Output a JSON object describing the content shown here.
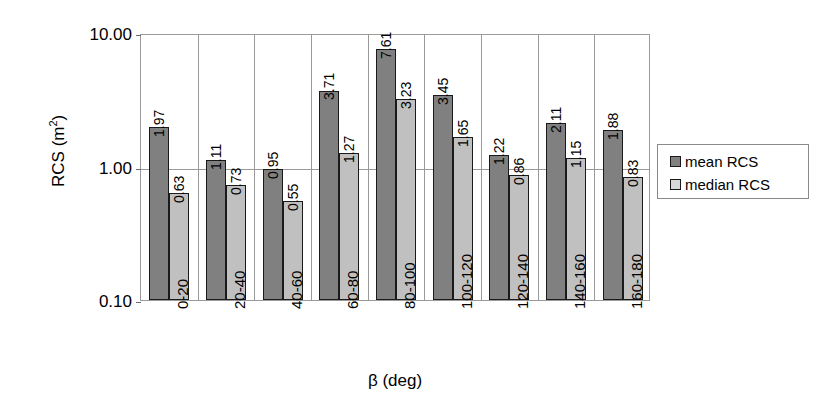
{
  "chart_data": {
    "type": "bar",
    "title": "",
    "xlabel": "β (deg)",
    "ylabel": "RCS (m²)",
    "yscale": "log",
    "ylim": [
      0.1,
      10.0
    ],
    "ytick_labels": [
      "10.00",
      "1.00",
      "0.10"
    ],
    "ytick_values": [
      10.0,
      1.0,
      0.1
    ],
    "grid": true,
    "legend_position": "right",
    "categories": [
      "0-20",
      "20-40",
      "40-60",
      "60-80",
      "80-100",
      "100-120",
      "120-140",
      "140-160",
      "160-180"
    ],
    "series": [
      {
        "name": "mean RCS",
        "color": "#808080",
        "values": [
          1.97,
          1.11,
          0.95,
          3.71,
          7.61,
          3.45,
          1.22,
          2.11,
          1.88
        ],
        "labels": [
          "1.97",
          "1.11",
          "0.95",
          "3.71",
          "7.61",
          "3.45",
          "1.22",
          "2.11",
          "1.88"
        ]
      },
      {
        "name": "median RCS",
        "color": "#c0c0c0",
        "values": [
          0.63,
          0.73,
          0.55,
          1.27,
          3.23,
          1.65,
          0.86,
          1.15,
          0.83
        ],
        "labels": [
          "0.63",
          "0.73",
          "0.55",
          "1.27",
          "3.23",
          "1.65",
          "0.86",
          "1.15",
          "0.83"
        ]
      }
    ]
  },
  "axes": {
    "y_title_main": "RCS (m",
    "y_title_sup": "2",
    "y_title_tail": ")",
    "x_title": "β (deg)"
  },
  "legend": {
    "entries": [
      {
        "label": "mean RCS",
        "swatch": "mean"
      },
      {
        "label": "median RCS",
        "swatch": "median"
      }
    ]
  },
  "colors": {
    "mean": "#808080",
    "median": "#c0c0c0",
    "axis": "#9a9a9a",
    "bar_outline": "#1a1a1a",
    "background": "#ffffff"
  }
}
